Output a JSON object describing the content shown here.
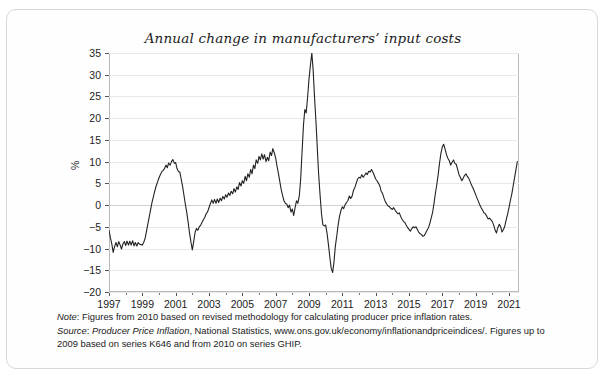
{
  "figure": {
    "title": "Annual change in manufacturers’ input costs",
    "border_color": "#d8d8d8",
    "line_color": "#222222",
    "grid_color": "#e9e9e9"
  },
  "axes": {
    "y_label": "%",
    "y_ticks": [
      "35",
      "30",
      "25",
      "20",
      "15",
      "10",
      "5",
      "0",
      "−5",
      "−10",
      "−15",
      "−20"
    ],
    "x_ticks": [
      "1997",
      "1999",
      "2001",
      "2003",
      "2005",
      "2007",
      "2009",
      "2011",
      "2013",
      "2015",
      "2017",
      "2019",
      "2021"
    ]
  },
  "notes": {
    "note_label": "Note",
    "note_text": ": Figures from 2010 based on revised methodology for calculating producer price inflation rates.",
    "source_label": "Source",
    "source_italic_title": "Producer Price Inflation",
    "source_text_a": ": ",
    "source_text_b": ", National Statistics, www.ons.gov.uk/economy/inflationandpriceindices/. Figures up to 2009",
    "source_text_c": "based on series K646 and from 2010 on series GHIP."
  },
  "chart_data": {
    "type": "line",
    "title": "Annual change in manufacturers’ input costs",
    "xlabel": "",
    "ylabel": "%",
    "xlim": [
      1997.0,
      2021.6
    ],
    "ylim": [
      -20,
      35
    ],
    "yticks": [
      -20,
      -15,
      -10,
      -5,
      0,
      5,
      10,
      15,
      20,
      25,
      30,
      35
    ],
    "xticks": [
      1997,
      1999,
      2001,
      2003,
      2005,
      2007,
      2009,
      2011,
      2013,
      2015,
      2017,
      2019,
      2021
    ],
    "grid": "horizontal",
    "legend": "none",
    "series": [
      {
        "name": "Annual change in manufacturers' input costs",
        "x": [
          1997.0,
          1997.08,
          1997.17,
          1997.25,
          1997.33,
          1997.42,
          1997.5,
          1997.58,
          1997.67,
          1997.75,
          1997.83,
          1997.92,
          1998.0,
          1998.08,
          1998.17,
          1998.25,
          1998.33,
          1998.42,
          1998.5,
          1998.58,
          1998.67,
          1998.75,
          1998.83,
          1998.92,
          1999.0,
          1999.08,
          1999.17,
          1999.25,
          1999.33,
          1999.42,
          1999.5,
          1999.58,
          1999.67,
          1999.75,
          1999.83,
          1999.92,
          2000.0,
          2000.08,
          2000.17,
          2000.25,
          2000.33,
          2000.42,
          2000.5,
          2000.58,
          2000.67,
          2000.75,
          2000.83,
          2000.92,
          2001.0,
          2001.08,
          2001.17,
          2001.25,
          2001.33,
          2001.42,
          2001.5,
          2001.58,
          2001.67,
          2001.75,
          2001.83,
          2001.92,
          2002.0,
          2002.08,
          2002.17,
          2002.25,
          2002.33,
          2002.42,
          2002.5,
          2002.58,
          2002.67,
          2002.75,
          2002.83,
          2002.92,
          2003.0,
          2003.08,
          2003.17,
          2003.25,
          2003.33,
          2003.42,
          2003.5,
          2003.58,
          2003.67,
          2003.75,
          2003.83,
          2003.92,
          2004.0,
          2004.08,
          2004.17,
          2004.25,
          2004.33,
          2004.42,
          2004.5,
          2004.58,
          2004.67,
          2004.75,
          2004.83,
          2004.92,
          2005.0,
          2005.08,
          2005.17,
          2005.25,
          2005.33,
          2005.42,
          2005.5,
          2005.58,
          2005.67,
          2005.75,
          2005.83,
          2005.92,
          2006.0,
          2006.08,
          2006.17,
          2006.25,
          2006.33,
          2006.42,
          2006.5,
          2006.58,
          2006.67,
          2006.75,
          2006.83,
          2006.92,
          2007.0,
          2007.08,
          2007.17,
          2007.25,
          2007.33,
          2007.42,
          2007.5,
          2007.58,
          2007.67,
          2007.75,
          2007.83,
          2007.92,
          2008.0,
          2008.08,
          2008.17,
          2008.25,
          2008.33,
          2008.42,
          2008.5,
          2008.58,
          2008.67,
          2008.75,
          2008.83,
          2008.92,
          2009.0,
          2009.08,
          2009.17,
          2009.25,
          2009.33,
          2009.42,
          2009.5,
          2009.58,
          2009.67,
          2009.75,
          2009.83,
          2009.92,
          2010.0,
          2010.08,
          2010.17,
          2010.25,
          2010.33,
          2010.42,
          2010.5,
          2010.58,
          2010.67,
          2010.75,
          2010.83,
          2010.92,
          2011.0,
          2011.08,
          2011.17,
          2011.25,
          2011.33,
          2011.42,
          2011.5,
          2011.58,
          2011.67,
          2011.75,
          2011.83,
          2011.92,
          2012.0,
          2012.08,
          2012.17,
          2012.25,
          2012.33,
          2012.42,
          2012.5,
          2012.58,
          2012.67,
          2012.75,
          2012.83,
          2012.92,
          2013.0,
          2013.08,
          2013.17,
          2013.25,
          2013.33,
          2013.42,
          2013.5,
          2013.58,
          2013.67,
          2013.75,
          2013.83,
          2013.92,
          2014.0,
          2014.08,
          2014.17,
          2014.25,
          2014.33,
          2014.42,
          2014.5,
          2014.58,
          2014.67,
          2014.75,
          2014.83,
          2014.92,
          2015.0,
          2015.08,
          2015.17,
          2015.25,
          2015.33,
          2015.42,
          2015.5,
          2015.58,
          2015.67,
          2015.75,
          2015.83,
          2015.92,
          2016.0,
          2016.08,
          2016.17,
          2016.25,
          2016.33,
          2016.42,
          2016.5,
          2016.58,
          2016.67,
          2016.75,
          2016.83,
          2016.92,
          2017.0,
          2017.08,
          2017.17,
          2017.25,
          2017.33,
          2017.42,
          2017.5,
          2017.58,
          2017.67,
          2017.75,
          2017.83,
          2017.92,
          2018.0,
          2018.08,
          2018.17,
          2018.25,
          2018.33,
          2018.42,
          2018.5,
          2018.58,
          2018.67,
          2018.75,
          2018.83,
          2018.92,
          2019.0,
          2019.08,
          2019.17,
          2019.25,
          2019.33,
          2019.42,
          2019.5,
          2019.58,
          2019.67,
          2019.75,
          2019.83,
          2019.92,
          2020.0,
          2020.08,
          2020.17,
          2020.25,
          2020.33,
          2020.42,
          2020.5,
          2020.58,
          2020.67,
          2020.75,
          2020.83,
          2020.92,
          2021.0,
          2021.08,
          2021.17,
          2021.25,
          2021.33,
          2021.42,
          2021.5
        ],
        "y": [
          -5.8,
          -7.4,
          -9.0,
          -10.9,
          -9.6,
          -8.6,
          -9.6,
          -8.4,
          -9.2,
          -10.1,
          -9.0,
          -8.4,
          -9.3,
          -8.3,
          -9.2,
          -8.3,
          -9.2,
          -8.2,
          -9.4,
          -8.6,
          -9.4,
          -8.6,
          -9.0,
          -9.1,
          -9.2,
          -8.6,
          -7.6,
          -6.0,
          -4.4,
          -2.6,
          -1.0,
          0.6,
          2.0,
          3.3,
          4.4,
          5.4,
          6.3,
          7.0,
          7.7,
          8.0,
          8.4,
          9.2,
          8.6,
          9.7,
          9.2,
          10.0,
          10.5,
          9.6,
          9.8,
          8.4,
          7.7,
          7.6,
          6.0,
          4.2,
          2.2,
          0.2,
          -1.8,
          -4.0,
          -6.4,
          -8.6,
          -10.3,
          -8.4,
          -6.2,
          -5.4,
          -5.8,
          -5.0,
          -4.6,
          -4.0,
          -3.3,
          -2.8,
          -2.0,
          -1.5,
          -0.6,
          0.3,
          1.2,
          0.4,
          1.3,
          0.4,
          1.4,
          0.6,
          1.6,
          1.0,
          2.0,
          1.4,
          2.4,
          1.8,
          2.8,
          2.2,
          3.2,
          2.6,
          3.8,
          3.0,
          4.2,
          3.6,
          5.2,
          4.4,
          5.6,
          5.0,
          6.6,
          5.6,
          7.2,
          6.4,
          8.2,
          7.2,
          9.2,
          8.4,
          10.4,
          9.6,
          11.2,
          10.4,
          11.8,
          10.6,
          11.6,
          10.0,
          11.0,
          10.2,
          12.2,
          11.4,
          13.0,
          12.0,
          10.8,
          9.0,
          7.2,
          5.4,
          3.6,
          2.1,
          1.0,
          0.4,
          0.2,
          -0.6,
          0.0,
          -1.6,
          -0.9,
          -2.4,
          -0.5,
          1.0,
          0.4,
          2.2,
          6.0,
          12.0,
          18.5,
          22.0,
          21.2,
          25.0,
          29.0,
          32.0,
          35.0,
          31.0,
          25.0,
          19.0,
          13.0,
          7.0,
          2.0,
          -2.0,
          -4.5,
          -4.8,
          -4.6,
          -6.4,
          -9.2,
          -12.0,
          -14.5,
          -15.5,
          -13.0,
          -9.5,
          -7.0,
          -4.5,
          -2.6,
          -1.2,
          -0.4,
          -0.8,
          0.1,
          0.6,
          1.0,
          2.1,
          1.5,
          2.0,
          3.4,
          4.0,
          5.0,
          6.0,
          6.4,
          6.2,
          7.0,
          6.4,
          6.8,
          7.4,
          7.0,
          7.8,
          7.6,
          8.2,
          7.6,
          6.8,
          6.0,
          5.6,
          5.0,
          4.4,
          3.2,
          2.6,
          1.6,
          0.8,
          0.2,
          -0.2,
          -0.4,
          -0.8,
          -1.0,
          -0.6,
          -1.2,
          -1.6,
          -2.0,
          -1.8,
          -2.6,
          -3.2,
          -3.8,
          -4.0,
          -4.6,
          -5.2,
          -5.6,
          -6.0,
          -5.4,
          -5.0,
          -5.2,
          -5.0,
          -5.6,
          -6.2,
          -6.6,
          -6.8,
          -7.2,
          -7.0,
          -6.4,
          -5.8,
          -5.2,
          -4.2,
          -3.0,
          -1.6,
          0.4,
          2.6,
          4.8,
          7.0,
          9.6,
          12.0,
          13.4,
          14.0,
          12.8,
          11.6,
          10.8,
          10.2,
          9.2,
          9.8,
          10.4,
          9.6,
          9.4,
          8.2,
          7.0,
          6.4,
          5.6,
          6.2,
          6.8,
          7.2,
          6.6,
          6.2,
          5.4,
          4.6,
          4.0,
          3.2,
          2.4,
          1.6,
          0.8,
          0.0,
          -0.6,
          -1.2,
          -1.8,
          -2.0,
          -2.6,
          -3.2,
          -3.0,
          -3.4,
          -3.8,
          -4.6,
          -5.8,
          -6.4,
          -5.2,
          -4.4,
          -5.0,
          -6.2,
          -5.6,
          -4.8,
          -3.4,
          -2.0,
          -0.6,
          1.0,
          2.6,
          4.4,
          6.2,
          8.2,
          10.0
        ]
      }
    ]
  }
}
